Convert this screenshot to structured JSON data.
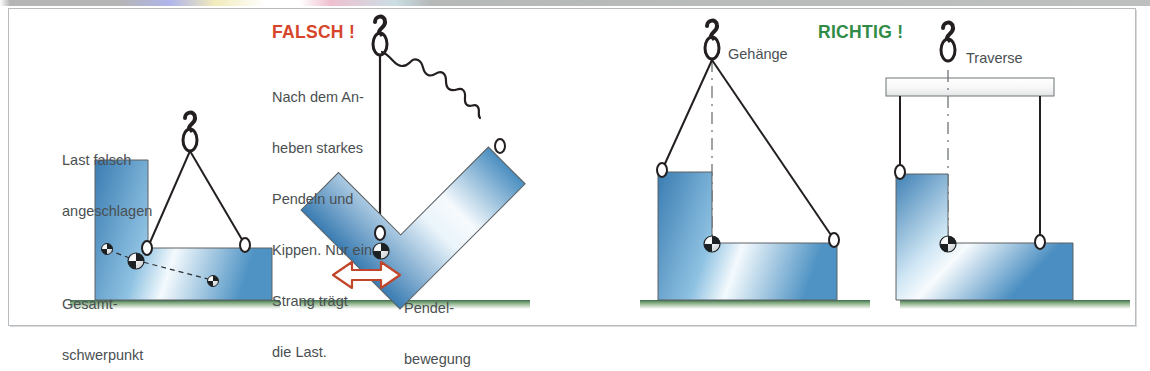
{
  "figure": {
    "title_left": "FALSCH !",
    "title_right": "RICHTIG !",
    "colors": {
      "wrong": "#d6452a",
      "right": "#2f8b45",
      "load_blue_edge": "#3b7fb5",
      "load_blue_center": "#f2f8fc",
      "ground_green": "#5f9a63",
      "rigging_black": "#231f20",
      "label_gray": "#4a4f52",
      "frame_gray": "#b9bcbe",
      "arrow_red": "#c0452a"
    }
  },
  "panels": [
    {
      "id": "panel-wrong-1",
      "verdict": "FALSCH !",
      "labels": {
        "top": "Last falsch\nangeschlagen",
        "bottom": "Gesamt-\nschwerpunkt"
      },
      "description": "Load incorrectly slung, centre of gravity off the hook line"
    },
    {
      "id": "panel-wrong-2",
      "verdict": "FALSCH !",
      "labels": {
        "body": "Nach dem An-\nheben starkes\nPendeln und\nKippen. Nur ein\nStrang trägt\ndie Last.",
        "arrow": "Pendel-\nbewegung"
      },
      "description": "After lifting, strong swinging and tipping. Only one strand carries the load."
    },
    {
      "id": "panel-right-1",
      "verdict": "RICHTIG !",
      "labels": {
        "component": "Gehänge"
      },
      "description": "Correct: sling assembly with adjusted strand lengths"
    },
    {
      "id": "panel-right-2",
      "verdict": "RICHTIG !",
      "labels": {
        "component": "Traverse"
      },
      "description": "Correct: spreader beam with vertical strands"
    }
  ],
  "text": {
    "last_falsch_angeschlagen_1": "Last falsch",
    "last_falsch_angeschlagen_2": "angeschlagen",
    "gesamt_1": "Gesamt-",
    "gesamt_2": "schwerpunkt",
    "falsch": "FALSCH !",
    "falsch_body_1": "Nach dem An-",
    "falsch_body_2": "heben starkes",
    "falsch_body_3": "Pendeln und",
    "falsch_body_4": "Kippen. Nur ein",
    "falsch_body_5": "Strang trägt",
    "falsch_body_6": "die Last.",
    "pendel_1": "Pendel-",
    "pendel_2": "bewegung",
    "richtig": "RICHTIG !",
    "gehaenge": "Gehänge",
    "traverse": "Traverse"
  }
}
